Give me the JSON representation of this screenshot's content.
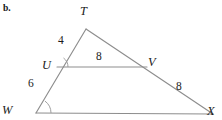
{
  "figure": {
    "item_label": "b.",
    "background_color": "#ffffff",
    "line_color": "#8d8d8d",
    "text_color": "#1b1b1b",
    "vertices": [
      {
        "name": "T",
        "label": "T",
        "x": 86,
        "y": 29,
        "label_x": 80,
        "label_y": 5
      },
      {
        "name": "U",
        "label": "U",
        "x": 57,
        "y": 67,
        "label_x": 42,
        "label_y": 59
      },
      {
        "name": "V",
        "label": "V",
        "x": 147,
        "y": 67,
        "label_x": 148,
        "label_y": 56
      },
      {
        "name": "W",
        "label": "W",
        "x": 36,
        "y": 113,
        "label_x": 2,
        "label_y": 104
      },
      {
        "name": "X",
        "label": "X",
        "x": 213,
        "y": 114,
        "label_x": 207,
        "label_y": 105
      }
    ],
    "segments": [
      {
        "name": "segment-t-w",
        "from": "T",
        "to": "W",
        "length_label": "4",
        "label_x": 58,
        "label_y": 35
      },
      {
        "name": "segment-u-w",
        "from": "U",
        "to": "W",
        "length_label": "6",
        "label_x": 28,
        "label_y": 78
      },
      {
        "name": "segment-u-v",
        "from": "U",
        "to": "V",
        "length_label": "8",
        "label_x": 96,
        "label_y": 51
      },
      {
        "name": "segment-v-x",
        "from": "V",
        "to": "X",
        "length_label": "8",
        "label_x": 176,
        "label_y": 81
      },
      {
        "name": "segment-t-x",
        "from": "T",
        "to": "X",
        "length_label": "",
        "label_x": 0,
        "label_y": 0
      },
      {
        "name": "segment-w-x",
        "from": "W",
        "to": "X",
        "length_label": "",
        "label_x": 0,
        "label_y": 0
      }
    ],
    "angle_marks": [
      {
        "name": "angle-mark-u",
        "vertex": "U",
        "radius": 11
      },
      {
        "name": "angle-mark-w",
        "vertex": "W",
        "radius": 15
      }
    ]
  }
}
